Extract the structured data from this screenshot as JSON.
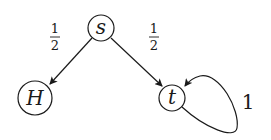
{
  "diagram": {
    "type": "markov-chain",
    "nodes": [
      {
        "id": "s",
        "label": "s"
      },
      {
        "id": "H",
        "label": "H"
      },
      {
        "id": "t",
        "label": "t"
      }
    ],
    "edges": [
      {
        "from": "s",
        "to": "H",
        "label_num": "1",
        "label_den": "2"
      },
      {
        "from": "s",
        "to": "t",
        "label_num": "1",
        "label_den": "2"
      },
      {
        "from": "t",
        "to": "t",
        "label": "1"
      }
    ],
    "colors": {
      "stroke": "#1a1a1a",
      "background": "#ffffff"
    }
  }
}
